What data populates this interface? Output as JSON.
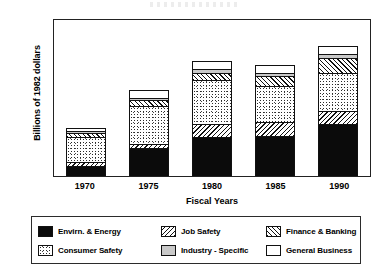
{
  "chart_data": {
    "type": "bar",
    "stacked": true,
    "title": "",
    "xlabel": "Fiscal Years",
    "ylabel": "Billions of 1982 dollars",
    "categories": [
      "1970",
      "1975",
      "1980",
      "1985",
      "1990"
    ],
    "ylim": [
      0,
      10
    ],
    "yticks": [
      0,
      2,
      4,
      6,
      8,
      10
    ],
    "ytick_labels": [
      "0",
      "2",
      "4",
      "6",
      "8",
      "10"
    ],
    "grid": false,
    "legend_position": "bottom",
    "series": [
      {
        "name": "Envirn. & Energy",
        "pattern": "solid-black",
        "values": [
          0.65,
          1.8,
          2.45,
          2.55,
          3.3
        ]
      },
      {
        "name": "Job Safety",
        "pattern": "backward-diagonal-hatch",
        "values": [
          0.25,
          0.2,
          0.85,
          0.85,
          0.8
        ]
      },
      {
        "name": "Consumer Safety",
        "pattern": "stipple-dots",
        "values": [
          1.6,
          2.45,
          2.75,
          2.3,
          2.45
        ]
      },
      {
        "name": "Finance & Banking",
        "pattern": "forward-diagonal-hatch",
        "values": [
          0.2,
          0.35,
          0.5,
          0.65,
          0.95
        ]
      },
      {
        "name": "Industry - Specific",
        "pattern": "light-gray-fill",
        "values": [
          0.1,
          0.15,
          0.25,
          0.2,
          0.2
        ]
      },
      {
        "name": "General Business",
        "pattern": "white-fill",
        "values": [
          0.2,
          0.5,
          0.5,
          0.5,
          0.55
        ]
      }
    ],
    "totals": [
      3.0,
      5.45,
      7.3,
      7.05,
      8.25
    ]
  },
  "legend": {
    "items": [
      {
        "label": "Envirn. & Energy",
        "swatch": "solid-black"
      },
      {
        "label": "Job Safety",
        "swatch": "backward-diagonal-hatch"
      },
      {
        "label": "Finance & Banking",
        "swatch": "forward-diagonal-hatch"
      },
      {
        "label": "Consumer Safety",
        "swatch": "stipple-dots"
      },
      {
        "label": "Industry - Specific",
        "swatch": "light-gray-fill"
      },
      {
        "label": "General Business",
        "swatch": "white-fill"
      }
    ]
  },
  "colors": {
    "ink": "#111111",
    "background": "#ffffff",
    "industry_fill": "#c9c9c9"
  }
}
